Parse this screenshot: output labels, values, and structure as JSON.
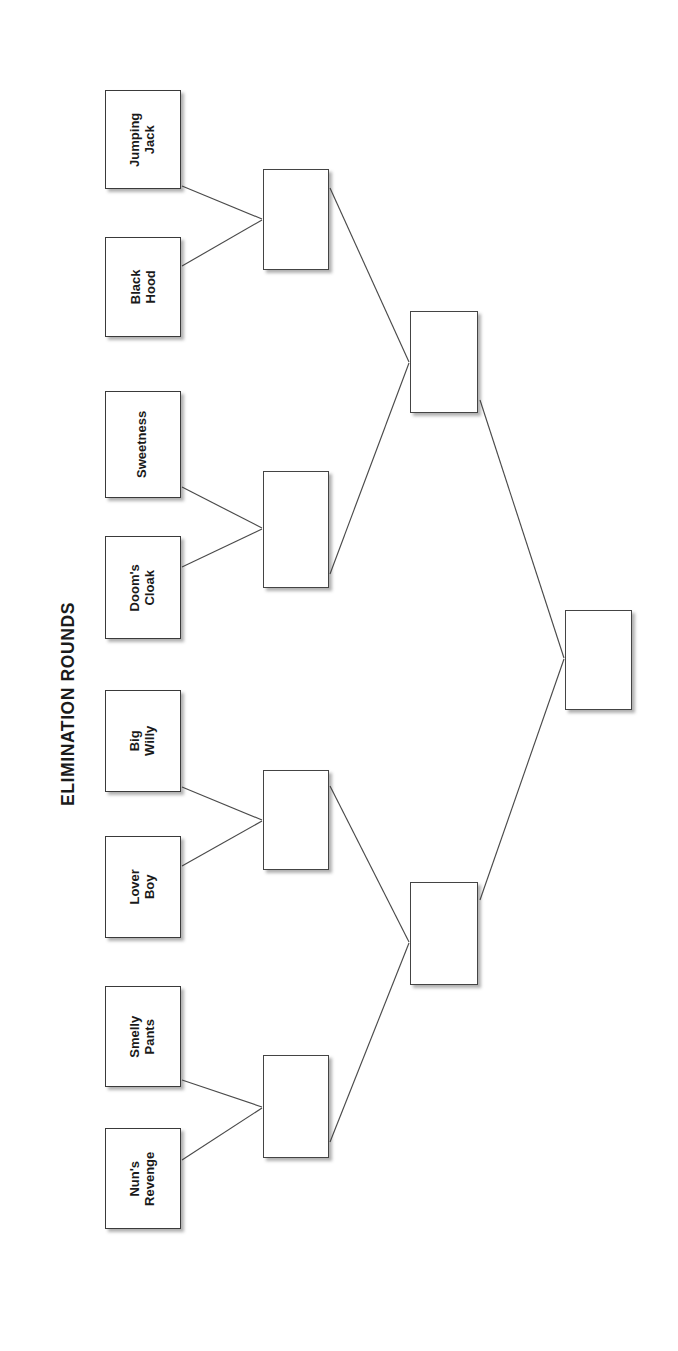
{
  "title": "ELIMINATION ROUNDS",
  "orientation": "rotated-90",
  "colors": {
    "box_border": "#3a3a3a",
    "box_fill": "#ffffff",
    "line": "#4a4a4a",
    "text": "#1a1a1a",
    "background": "#ffffff"
  },
  "rounds": [
    {
      "name": "round-1",
      "label": "Round 1",
      "competitors": [
        {
          "id": "r1-1",
          "line1": "Jumping",
          "line2": "Jack",
          "full": "Jumping Jack"
        },
        {
          "id": "r1-2",
          "line1": "Black",
          "line2": "Hood",
          "full": "Black Hood"
        },
        {
          "id": "r1-3",
          "line1": "Sweetness",
          "line2": "",
          "full": "Sweetness"
        },
        {
          "id": "r1-4",
          "line1": "Doom's",
          "line2": "Cloak",
          "full": "Doom's Cloak"
        },
        {
          "id": "r1-5",
          "line1": "Big",
          "line2": "Willy",
          "full": "Big Willy"
        },
        {
          "id": "r1-6",
          "line1": "Lover",
          "line2": "Boy",
          "full": "Lover Boy"
        },
        {
          "id": "r1-7",
          "line1": "Smelly",
          "line2": "Pants",
          "full": "Smelly Pants"
        },
        {
          "id": "r1-8",
          "line1": "Nun's",
          "line2": "Revenge",
          "full": "Nun's Revenge"
        }
      ]
    },
    {
      "name": "round-2",
      "label": "Quarterfinals",
      "slots": [
        {
          "id": "r2-1",
          "value": ""
        },
        {
          "id": "r2-2",
          "value": ""
        },
        {
          "id": "r2-3",
          "value": ""
        },
        {
          "id": "r2-4",
          "value": ""
        }
      ]
    },
    {
      "name": "round-3",
      "label": "Semifinals",
      "slots": [
        {
          "id": "r3-1",
          "value": ""
        },
        {
          "id": "r3-2",
          "value": ""
        }
      ]
    },
    {
      "name": "final",
      "label": "Final",
      "slots": [
        {
          "id": "final-1",
          "value": ""
        }
      ]
    }
  ]
}
